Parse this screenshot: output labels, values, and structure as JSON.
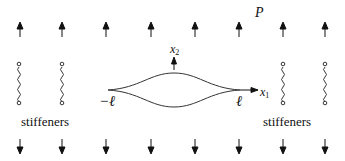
{
  "diagram": {
    "load_label": "P",
    "axes": {
      "x1_label": "x",
      "x1_sub": "1",
      "x2_label": "x",
      "x2_sub": "2"
    },
    "crack": {
      "left_tip_label": "−ℓ",
      "right_tip_label": "ℓ"
    },
    "stiffeners": {
      "left_label": "stiffeners",
      "right_label": "stiffeners"
    },
    "arrow_x_positions": [
      20,
      62,
      106,
      151,
      195,
      239,
      283,
      325
    ],
    "spring_x_positions": [
      19,
      62,
      283,
      325
    ],
    "colors": {
      "stroke": "#111111",
      "background": "#ffffff"
    }
  }
}
